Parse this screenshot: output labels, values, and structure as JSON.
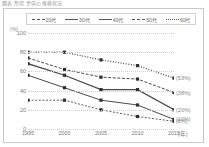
{
  "title": "図表  所得  世帯の推移状況",
  "axis": {
    "y_unit": "(%)",
    "x_unit": "(年)",
    "yticks": [
      100,
      80,
      60,
      40,
      20,
      0
    ],
    "xticks": [
      "1995",
      "2000",
      "2005",
      "2010",
      "2015"
    ]
  },
  "legend": [
    {
      "label": "20代",
      "style": "s20"
    },
    {
      "label": "30代",
      "style": "s30"
    },
    {
      "label": "40代",
      "style": "s40"
    },
    {
      "label": "50代",
      "style": "s50"
    },
    {
      "label": "60代",
      "style": "s60"
    }
  ],
  "annotations": [
    "(53%)",
    "(38%)",
    "(20%)",
    "(10%)",
    "(8%)"
  ],
  "chart_data": {
    "type": "line",
    "title": "図表  所得  世帯の推移状況",
    "xlabel": "(年)",
    "ylabel": "(%)",
    "ylim": [
      0,
      100
    ],
    "grid": true,
    "legend_position": "top",
    "categories": [
      "1995",
      "2000",
      "2005",
      "2010",
      "2015"
    ],
    "series": [
      {
        "name": "60代",
        "values": [
          80,
          80,
          72,
          66,
          53
        ],
        "end_label": "(53%)"
      },
      {
        "name": "50代",
        "values": [
          74,
          62,
          54,
          52,
          38
        ],
        "end_label": "(38%)"
      },
      {
        "name": "40代",
        "values": [
          68,
          56,
          41,
          41,
          20
        ],
        "end_label": "(20%)"
      },
      {
        "name": "30代",
        "values": [
          56,
          43,
          30,
          25,
          10
        ],
        "end_label": "(10%)"
      },
      {
        "name": "20代",
        "values": [
          30,
          30,
          20,
          13,
          8
        ],
        "end_label": "(8%)"
      }
    ]
  }
}
